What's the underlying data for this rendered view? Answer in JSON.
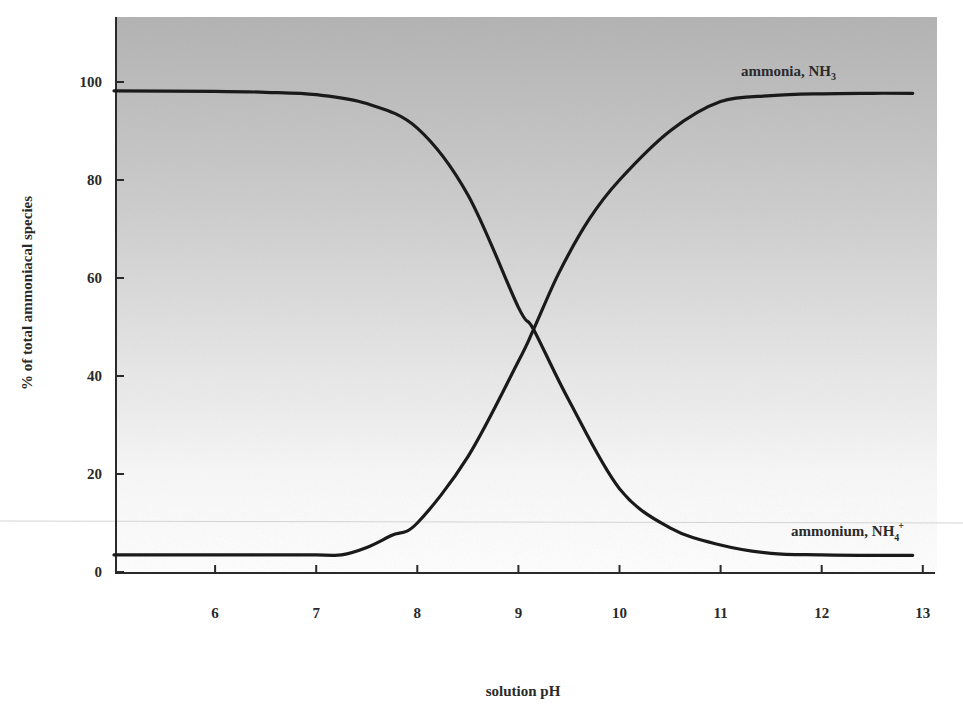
{
  "chart_data": {
    "type": "line",
    "title": "",
    "xlabel": "solution pH",
    "ylabel": "% of total ammoniacal species",
    "xlim": [
      5,
      13.1
    ],
    "ylim": [
      0,
      112
    ],
    "x_ticks": [
      6,
      7,
      8,
      9,
      10,
      11,
      12,
      13
    ],
    "y_ticks": [
      0,
      20,
      40,
      60,
      80,
      100
    ],
    "grid": false,
    "legend": "inline labels at right end of curves",
    "background": "vertical gradient gray (top) to white (bottom)",
    "series": [
      {
        "name": "ammonium, NH4+",
        "label_main": "ammonium, NH",
        "label_sub": "4",
        "label_sup": "+",
        "trend": "decreasing sigmoid",
        "x": [
          5.0,
          6.0,
          6.5,
          7.0,
          7.5,
          8.0,
          8.5,
          9.0,
          9.15,
          9.5,
          10.0,
          10.5,
          11.0,
          11.5,
          12.0,
          12.5,
          12.9
        ],
        "values": [
          98.2,
          98.1,
          97.9,
          97.4,
          95.6,
          90.6,
          77.0,
          54.0,
          49.5,
          35.0,
          17.0,
          9.0,
          5.5,
          3.8,
          3.5,
          3.4,
          3.4
        ]
      },
      {
        "name": "ammonia, NH3",
        "label_main": "ammonia, NH",
        "label_sub": "3",
        "trend": "increasing sigmoid",
        "x": [
          5.0,
          6.0,
          7.0,
          7.25,
          7.5,
          7.75,
          8.0,
          8.5,
          9.0,
          9.15,
          9.4,
          9.7,
          10.0,
          10.5,
          11.0,
          11.5,
          12.0,
          12.5,
          12.9
        ],
        "values": [
          3.5,
          3.5,
          3.5,
          3.5,
          5.0,
          7.5,
          10.0,
          23.5,
          43.0,
          49.5,
          61.0,
          72.0,
          80.0,
          90.0,
          96.0,
          97.2,
          97.6,
          97.7,
          97.7
        ]
      }
    ]
  },
  "colors": {
    "line": "#1a1a1a",
    "axis": "#2a2a2a",
    "bg_top": "#b4b4b4",
    "bg_bottom": "#ffffff"
  }
}
